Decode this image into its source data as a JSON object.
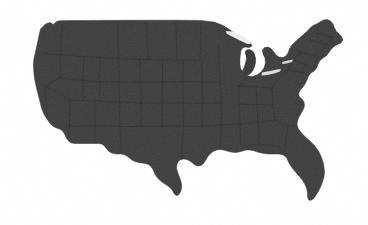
{
  "figure": {
    "kind": "map",
    "title": "",
    "caption": "",
    "has_text_labels": false,
    "width_px": 368,
    "height_px": 225
  },
  "colors": {
    "background": "#ffffff",
    "land_fill": "#3c3c3c",
    "land_fill_dark": "#333333",
    "state_border": "#2a2a2a",
    "outline": "#353535",
    "water_cutout": "#ffffff"
  },
  "style": {
    "rendering": "scanned-raster-grain",
    "state_borders_visible": true,
    "state_border_opacity": 0.55,
    "coastline_stroke_width": 0.4,
    "grain_opacity": 0.22
  },
  "map_extent": {
    "left_px": 33,
    "top_px": 19,
    "right_px": 346,
    "bottom_px": 201
  },
  "features": [
    {
      "name": "pacific-northwest-coast",
      "visible": true
    },
    {
      "name": "california-coast",
      "visible": true
    },
    {
      "name": "baja-border-notch",
      "visible": true
    },
    {
      "name": "texas-gulf-coast",
      "visible": true
    },
    {
      "name": "rio-grande-border",
      "visible": true
    },
    {
      "name": "florida-peninsula",
      "visible": true
    },
    {
      "name": "great-lakes-cutout",
      "visible": true
    },
    {
      "name": "lake-michigan",
      "visible": true
    },
    {
      "name": "lake-superior",
      "visible": true
    },
    {
      "name": "michigan-upper-peninsula",
      "visible": true
    },
    {
      "name": "michigan-lower-peninsula",
      "visible": true
    },
    {
      "name": "maine-northeast-tip",
      "visible": true
    },
    {
      "name": "cape-cod",
      "visible": true
    },
    {
      "name": "chesapeake-bay",
      "visible": true
    },
    {
      "name": "canada-border-49th-parallel",
      "visible": true
    }
  ],
  "state_border_lines": {
    "description": "faint darker lines subdividing the silhouette into states",
    "count_visible": 40
  }
}
